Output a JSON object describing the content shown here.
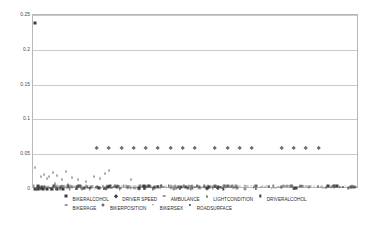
{
  "chart_data": {
    "type": "scatter",
    "title": "",
    "subtitle": "",
    "xlabel": "",
    "ylabel": "",
    "xlim": [
      0,
      120
    ],
    "ylim": [
      0,
      0.25
    ],
    "grid": true,
    "legend_position": "bottom",
    "y_ticks": [
      "0",
      "0.05",
      "0.1",
      "0.15",
      "0.2",
      "0.25"
    ],
    "y_tick_values": [
      0,
      0.05,
      0.1,
      0.15,
      0.2,
      0.25
    ],
    "x_ticks": [],
    "series": [
      {
        "name": "BIKERALCOHOL",
        "marker": "square",
        "color": "#3a3a3a",
        "points": [
          {
            "x": 0.6,
            "y": 0.238
          },
          {
            "x": 0.6,
            "y": 0.0
          },
          {
            "x": 2.0,
            "y": 0.0
          },
          {
            "x": 3.5,
            "y": 0.0
          },
          {
            "x": 5.0,
            "y": 0.0
          },
          {
            "x": 7.0,
            "y": 0.0
          },
          {
            "x": 9.0,
            "y": 0.0
          },
          {
            "x": 11.0,
            "y": 0.0
          }
        ]
      },
      {
        "name": "DRIVER SPEED",
        "marker": "diamond",
        "color": "#6e6e6e",
        "points": [
          {
            "x": 24.0,
            "y": 0.058
          },
          {
            "x": 28.5,
            "y": 0.058
          },
          {
            "x": 33.0,
            "y": 0.058
          },
          {
            "x": 37.5,
            "y": 0.058
          },
          {
            "x": 42.0,
            "y": 0.058
          },
          {
            "x": 46.5,
            "y": 0.058
          },
          {
            "x": 51.0,
            "y": 0.058
          },
          {
            "x": 55.5,
            "y": 0.058
          },
          {
            "x": 60.0,
            "y": 0.058
          },
          {
            "x": 67.5,
            "y": 0.058
          },
          {
            "x": 72.0,
            "y": 0.058
          },
          {
            "x": 76.5,
            "y": 0.058
          },
          {
            "x": 81.0,
            "y": 0.058
          },
          {
            "x": 92.0,
            "y": 0.058
          },
          {
            "x": 96.5,
            "y": 0.058
          },
          {
            "x": 101.0,
            "y": 0.058
          },
          {
            "x": 105.5,
            "y": 0.058
          }
        ]
      },
      {
        "name": "AMBULANCE",
        "marker": "dash",
        "color": "#8a8a8a",
        "points": [
          {
            "x": 14.0,
            "y": 0.003
          },
          {
            "x": 30.0,
            "y": 0.003
          },
          {
            "x": 48.0,
            "y": 0.003
          },
          {
            "x": 66.0,
            "y": 0.003
          },
          {
            "x": 84.0,
            "y": 0.003
          },
          {
            "x": 99.0,
            "y": 0.003
          }
        ]
      },
      {
        "name": "LIGHTCONDITION",
        "marker": "triangle",
        "color": "#7d7d7d",
        "points": [
          {
            "x": 0.8,
            "y": 0.032
          },
          {
            "x": 3.0,
            "y": 0.018
          },
          {
            "x": 4.2,
            "y": 0.021
          },
          {
            "x": 5.0,
            "y": 0.016
          },
          {
            "x": 6.0,
            "y": 0.019
          },
          {
            "x": 7.5,
            "y": 0.024
          },
          {
            "x": 9.0,
            "y": 0.02
          },
          {
            "x": 10.5,
            "y": 0.015
          },
          {
            "x": 12.0,
            "y": 0.026
          },
          {
            "x": 14.5,
            "y": 0.017
          },
          {
            "x": 16.5,
            "y": 0.014
          },
          {
            "x": 19.5,
            "y": 0.012
          },
          {
            "x": 22.5,
            "y": 0.019
          },
          {
            "x": 24.5,
            "y": 0.016
          },
          {
            "x": 26.5,
            "y": 0.023
          },
          {
            "x": 28.0,
            "y": 0.027
          },
          {
            "x": 36.0,
            "y": 0.014
          },
          {
            "x": 8.0,
            "y": 0.009
          },
          {
            "x": 13.0,
            "y": 0.007
          }
        ]
      },
      {
        "name": "DRIVERALCOHOL",
        "marker": "bar",
        "color": "#4d4d4d",
        "points": [
          {
            "x": 1.5,
            "y": 0.0
          },
          {
            "x": 6.5,
            "y": 0.0
          },
          {
            "x": 13.5,
            "y": 0.0
          },
          {
            "x": 21.0,
            "y": 0.0
          },
          {
            "x": 32.0,
            "y": 0.0
          },
          {
            "x": 44.0,
            "y": 0.0
          },
          {
            "x": 58.0,
            "y": 0.0
          },
          {
            "x": 70.0,
            "y": 0.0
          }
        ]
      },
      {
        "name": "BIKERAGE",
        "marker": "dash",
        "color": "#9a9a9a",
        "points": [
          {
            "x": 86.0,
            "y": 0.004
          },
          {
            "x": 90.0,
            "y": 0.003
          },
          {
            "x": 94.0,
            "y": 0.004
          },
          {
            "x": 98.0,
            "y": 0.003
          },
          {
            "x": 102.0,
            "y": 0.004
          },
          {
            "x": 106.0,
            "y": 0.003
          },
          {
            "x": 110.0,
            "y": 0.004
          },
          {
            "x": 114.0,
            "y": 0.003
          }
        ]
      },
      {
        "name": "BIKERPOSITION",
        "marker": "plus",
        "color": "#6b6b6b",
        "points": [
          {
            "x": 2.5,
            "y": 0.0
          },
          {
            "x": 10.0,
            "y": 0.0
          },
          {
            "x": 18.0,
            "y": 0.0
          },
          {
            "x": 27.0,
            "y": 0.0
          },
          {
            "x": 39.0,
            "y": 0.0
          },
          {
            "x": 52.0,
            "y": 0.0
          },
          {
            "x": 64.0,
            "y": 0.0
          },
          {
            "x": 78.0,
            "y": 0.0
          }
        ]
      },
      {
        "name": "BIKERSEX",
        "marker": "x",
        "color": "#707070",
        "points": [
          {
            "x": 4.5,
            "y": 0.0
          },
          {
            "x": 12.5,
            "y": 0.0
          },
          {
            "x": 23.0,
            "y": 0.0
          },
          {
            "x": 35.0,
            "y": 0.0
          },
          {
            "x": 47.0,
            "y": 0.0
          },
          {
            "x": 61.0,
            "y": 0.0
          },
          {
            "x": 74.0,
            "y": 0.0
          },
          {
            "x": 88.0,
            "y": 0.0
          }
        ]
      },
      {
        "name": "ROADSURFACE",
        "marker": "dot",
        "color": "#5c5c5c",
        "points": [
          {
            "x": 8.5,
            "y": 0.0
          },
          {
            "x": 16.0,
            "y": 0.0
          },
          {
            "x": 26.0,
            "y": 0.0
          },
          {
            "x": 41.0,
            "y": 0.0
          },
          {
            "x": 54.0,
            "y": 0.0
          },
          {
            "x": 68.0,
            "y": 0.0
          },
          {
            "x": 82.0,
            "y": 0.0
          },
          {
            "x": 96.0,
            "y": 0.0
          }
        ]
      }
    ]
  },
  "legend": {
    "rows": [
      [
        {
          "label": "BIKERALCOHOL",
          "marker": "square"
        },
        {
          "label": "DRIVER SPEED",
          "marker": "diamond"
        },
        {
          "label": "AMBULANCE",
          "marker": "dash"
        },
        {
          "label": "LIGHTCONDITION",
          "marker": "triangle"
        },
        {
          "label": "DRIVERALCOHOL",
          "marker": "bar"
        }
      ],
      [
        {
          "label": "BIKERAGE",
          "marker": "dash"
        },
        {
          "label": "BIKERPOSITION",
          "marker": "plus"
        },
        {
          "label": "BIKERSEX",
          "marker": "x"
        },
        {
          "label": "ROADSURFACE",
          "marker": "dot"
        }
      ]
    ]
  }
}
